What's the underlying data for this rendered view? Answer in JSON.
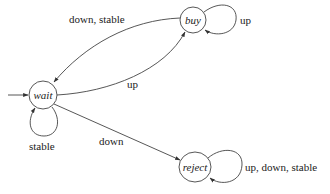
{
  "diagram": {
    "type": "state-machine",
    "states": [
      {
        "id": "wait",
        "label": "wait",
        "initial": true
      },
      {
        "id": "buy",
        "label": "buy"
      },
      {
        "id": "reject",
        "label": "reject"
      }
    ],
    "transitions": [
      {
        "from": "buy",
        "to": "wait",
        "label": "down, stable"
      },
      {
        "from": "buy",
        "to": "buy",
        "label": "up"
      },
      {
        "from": "wait",
        "to": "buy",
        "label": "up"
      },
      {
        "from": "wait",
        "to": "wait",
        "label": "stable"
      },
      {
        "from": "wait",
        "to": "reject",
        "label": "down"
      },
      {
        "from": "reject",
        "to": "reject",
        "label": "up, down, stable"
      }
    ]
  },
  "labels": {
    "state_wait": "wait",
    "state_buy": "buy",
    "state_reject": "reject",
    "edge_buy_wait": "down, stable",
    "edge_buy_self": "up",
    "edge_wait_buy": "up",
    "edge_wait_self": "stable",
    "edge_wait_reject": "down",
    "edge_reject_self": "up, down, stable"
  },
  "colors": {
    "stroke": "#444444",
    "text": "#222222",
    "background": "#ffffff"
  }
}
